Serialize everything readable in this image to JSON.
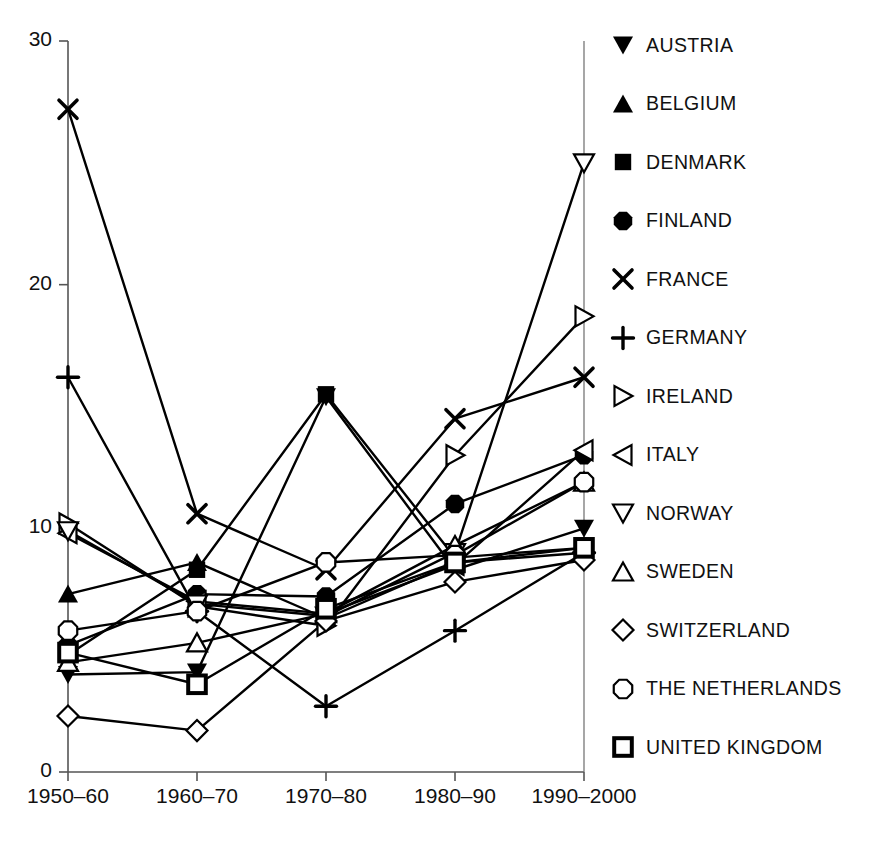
{
  "chart_data": {
    "type": "line",
    "title": "",
    "xlabel": "",
    "ylabel": "",
    "categories": [
      "1950–60",
      "1960–70",
      "1970–80",
      "1980–90",
      "1990–2000"
    ],
    "ylim": [
      0,
      30
    ],
    "yticks": [
      0,
      10,
      20,
      30
    ],
    "ytick_labels": [
      "0",
      "10",
      "20",
      "30"
    ],
    "grid": false,
    "legend_position": "right",
    "series": [
      {
        "name": "AUSTRIA",
        "marker": "triangle-down-filled",
        "values": [
          4.0,
          4.1,
          15.4,
          8.3,
          10.0
        ]
      },
      {
        "name": "BELGIUM",
        "marker": "triangle-up-filled",
        "values": [
          7.3,
          8.6,
          6.3,
          8.6,
          9.0
        ]
      },
      {
        "name": "DENMARK",
        "marker": "square-filled",
        "values": [
          4.8,
          8.3,
          15.5,
          8.8,
          9.2
        ]
      },
      {
        "name": "FINLAND",
        "marker": "octagon-filled",
        "values": [
          5.2,
          7.3,
          7.2,
          11.0,
          13.0
        ]
      },
      {
        "name": "FRANCE",
        "marker": "x",
        "values": [
          27.2,
          10.6,
          8.3,
          14.5,
          16.2
        ]
      },
      {
        "name": "GERMANY",
        "marker": "plus",
        "values": [
          16.2,
          6.6,
          2.7,
          5.8,
          9.0
        ]
      },
      {
        "name": "IRELAND",
        "marker": "triangle-right-open",
        "values": [
          10.2,
          6.8,
          6.0,
          13.0,
          18.7
        ]
      },
      {
        "name": "ITALY",
        "marker": "triangle-left-open",
        "values": [
          9.8,
          7.0,
          6.5,
          8.5,
          13.2
        ]
      },
      {
        "name": "NORWAY",
        "marker": "triangle-down-open",
        "values": [
          9.9,
          6.9,
          6.4,
          9.0,
          25.0
        ]
      },
      {
        "name": "SWEDEN",
        "marker": "triangle-up-open",
        "values": [
          4.5,
          5.3,
          6.5,
          9.3,
          11.9
        ]
      },
      {
        "name": "SWITZERLAND",
        "marker": "diamond-open",
        "values": [
          2.3,
          1.7,
          6.2,
          7.8,
          8.7
        ]
      },
      {
        "name": "THE NETHERLANDS",
        "marker": "octagon-open",
        "values": [
          5.8,
          6.6,
          8.6,
          8.9,
          11.9
        ]
      },
      {
        "name": "UNITED KINGDOM",
        "marker": "square-open",
        "values": [
          4.9,
          3.6,
          6.7,
          8.6,
          9.2
        ]
      }
    ]
  },
  "axes": {
    "y_labels": [
      "30",
      "20",
      "10",
      "0"
    ],
    "x_labels": [
      "1950–60",
      "1960–70",
      "1970–80",
      "1980–90",
      "1990–2000"
    ]
  },
  "legend": {
    "items": [
      {
        "label": "AUSTRIA",
        "marker": "triangle-down-filled"
      },
      {
        "label": "BELGIUM",
        "marker": "triangle-up-filled"
      },
      {
        "label": "DENMARK",
        "marker": "square-filled"
      },
      {
        "label": "FINLAND",
        "marker": "octagon-filled"
      },
      {
        "label": "FRANCE",
        "marker": "x"
      },
      {
        "label": "GERMANY",
        "marker": "plus"
      },
      {
        "label": "IRELAND",
        "marker": "triangle-right-open"
      },
      {
        "label": "ITALY",
        "marker": "triangle-left-open"
      },
      {
        "label": "NORWAY",
        "marker": "triangle-down-open"
      },
      {
        "label": "SWEDEN",
        "marker": "triangle-up-open"
      },
      {
        "label": "SWITZERLAND",
        "marker": "diamond-open"
      },
      {
        "label": "THE NETHERLANDS",
        "marker": "octagon-open"
      },
      {
        "label": "UNITED KINGDOM",
        "marker": "square-open"
      }
    ]
  },
  "colors": {
    "line": "#000000",
    "axis": "#444444",
    "text": "#111111"
  }
}
